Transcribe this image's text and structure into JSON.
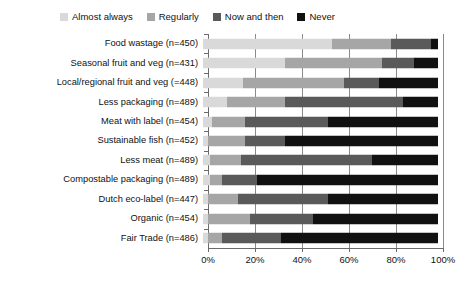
{
  "chart_data": {
    "type": "bar",
    "subtype": "stacked-horizontal-100pct",
    "title": "",
    "subtitle": "",
    "xlabel": "",
    "ylabel": "",
    "xlim": [
      0,
      100
    ],
    "grid": true,
    "legend_position": "top",
    "xticks": [
      0,
      20,
      40,
      60,
      80,
      100
    ],
    "xticklabels": [
      "0%",
      "20%",
      "40%",
      "60%",
      "80%",
      "100%"
    ],
    "categories": [
      "Food wastage (n=450)",
      "Seasonal fruit and veg (n=431)",
      "Local/regional fruit and veg (=448)",
      "Less packaging (n=489)",
      "Meat with label (n=454)",
      "Sustainable fish (n=452)",
      "Less meat (n=489)",
      "Compostable packaging (n=489)",
      "Dutch eco-label (n=447)",
      "Organic (n=454)",
      "Fair Trade (n=486)"
    ],
    "series": [
      {
        "name": "Almost always",
        "color": "#d9d9d9",
        "values": [
          55,
          35,
          17,
          10,
          4,
          2,
          3,
          3,
          2,
          2,
          2
        ]
      },
      {
        "name": "Regularly",
        "color": "#a6a6a6",
        "values": [
          25,
          41,
          43,
          25,
          14,
          16,
          13,
          5,
          13,
          18,
          6
        ]
      },
      {
        "name": "Now and then",
        "color": "#5a5a5a",
        "values": [
          17,
          14,
          15,
          50,
          35,
          17,
          56,
          15,
          38,
          27,
          25
        ]
      },
      {
        "name": "Never",
        "color": "#111111",
        "values": [
          3,
          10,
          25,
          15,
          47,
          65,
          28,
          77,
          47,
          53,
          67
        ]
      }
    ]
  },
  "legend": {
    "items": [
      {
        "label": "Almost always",
        "color": "#d9d9d9"
      },
      {
        "label": "Regularly",
        "color": "#a6a6a6"
      },
      {
        "label": "Now and then",
        "color": "#5a5a5a"
      },
      {
        "label": "Never",
        "color": "#111111"
      }
    ]
  }
}
